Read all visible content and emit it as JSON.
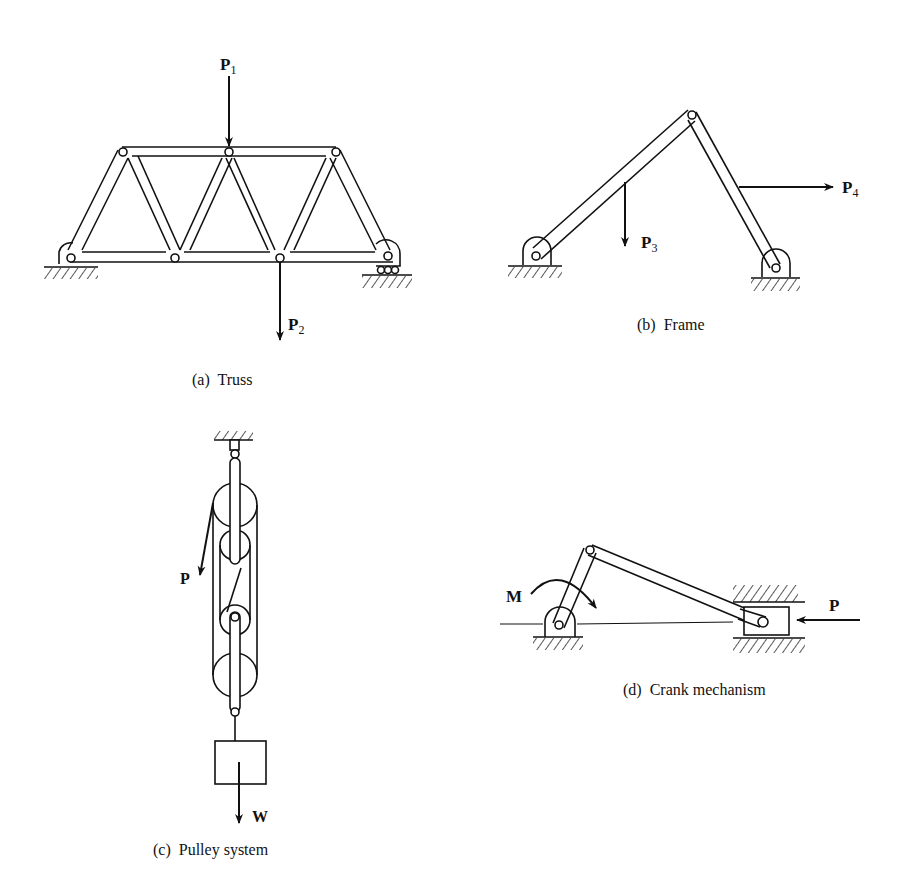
{
  "figure": {
    "panels": [
      {
        "id": "a",
        "caption": "(a)  Truss",
        "loads": [
          {
            "symbol": "P",
            "subscript": "1",
            "direction": "down",
            "applied_at": "top chord middle joint"
          },
          {
            "symbol": "P",
            "subscript": "2",
            "direction": "down",
            "applied_at": "bottom chord joint"
          }
        ],
        "supports": [
          "pin support (left)",
          "roller support (right)"
        ]
      },
      {
        "id": "b",
        "caption": "(b)  Frame",
        "loads": [
          {
            "symbol": "P",
            "subscript": "3",
            "direction": "down",
            "applied_at": "left member"
          },
          {
            "symbol": "P",
            "subscript": "4",
            "direction": "right",
            "applied_at": "right member"
          }
        ],
        "supports": [
          "pin support (left)",
          "pin support (right)"
        ]
      },
      {
        "id": "c",
        "caption": "(c)  Pulley system",
        "loads": [
          {
            "symbol": "P",
            "subscript": "",
            "direction": "down-left",
            "applied_at": "rope end"
          },
          {
            "symbol": "W",
            "subscript": "",
            "direction": "down",
            "applied_at": "hanging block"
          }
        ],
        "supports": [
          "fixed ceiling"
        ]
      },
      {
        "id": "d",
        "caption": "(d)  Crank mechanism",
        "loads": [
          {
            "symbol": "M",
            "subscript": "",
            "direction": "clockwise moment",
            "applied_at": "crank"
          },
          {
            "symbol": "P",
            "subscript": "",
            "direction": "left",
            "applied_at": "slider"
          }
        ],
        "supports": [
          "pin support",
          "slider guides"
        ]
      }
    ]
  },
  "colors": {
    "ink": "#111111",
    "background": "#ffffff"
  }
}
